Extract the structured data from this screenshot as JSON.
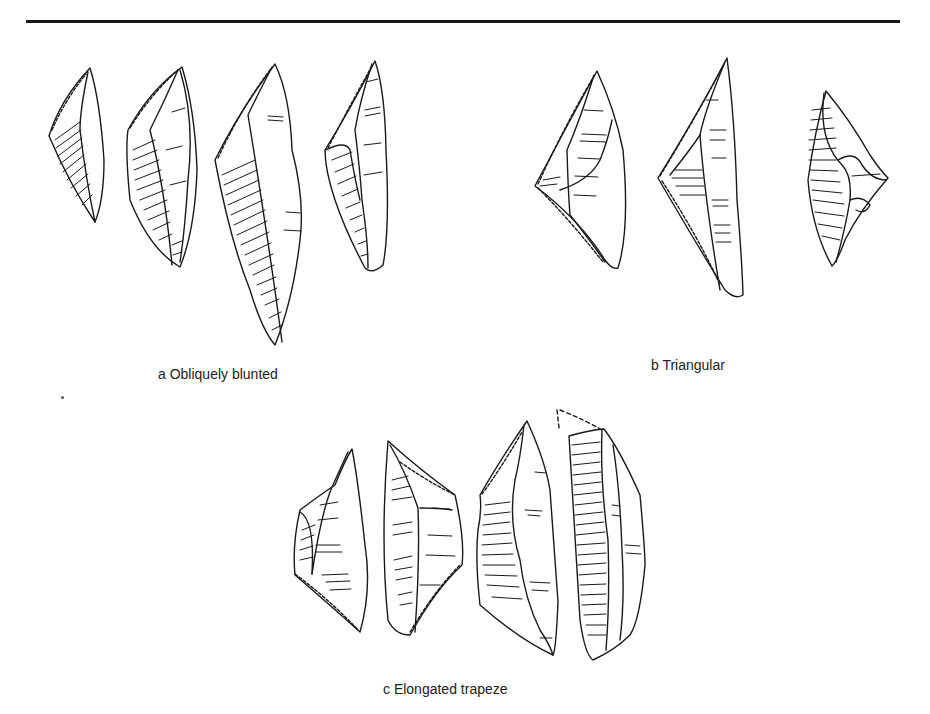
{
  "figure": {
    "groups": [
      {
        "id": "a",
        "letter": "a",
        "label": "Obliquely blunted",
        "caption": "a  Obliquely blunted",
        "specimen_count": 4
      },
      {
        "id": "b",
        "letter": "b",
        "label": "Triangular",
        "caption": "b  Triangular",
        "specimen_count": 3
      },
      {
        "id": "c",
        "letter": "c",
        "label": "Elongated trapeze",
        "caption": "c  Elongated trapeze",
        "specimen_count": 4
      }
    ]
  },
  "colors": {
    "ink": "#1a1a1a",
    "paper": "#ffffff"
  }
}
